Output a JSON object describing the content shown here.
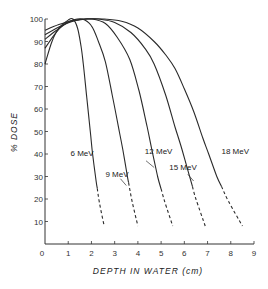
{
  "chart_data": {
    "type": "line",
    "title": "",
    "xlabel": "DEPTH IN WATER (cm)",
    "ylabel": "% DOSE",
    "xlim": [
      0,
      9
    ],
    "ylim": [
      0,
      100
    ],
    "x_ticks": [
      0,
      1,
      2,
      3,
      4,
      5,
      6,
      7,
      8,
      9
    ],
    "y_ticks": [
      10,
      20,
      30,
      40,
      50,
      60,
      70,
      80,
      90,
      100
    ],
    "grid": false,
    "legend": "inline labels",
    "series": [
      {
        "name": "6 MeV",
        "label": "6 MeV",
        "points": [
          [
            0,
            80
          ],
          [
            0.3,
            90
          ],
          [
            0.6,
            96
          ],
          [
            1.0,
            99.5
          ],
          [
            1.2,
            100
          ],
          [
            1.4,
            96
          ],
          [
            1.55,
            88
          ],
          [
            1.65,
            80
          ],
          [
            1.8,
            65
          ],
          [
            1.95,
            50
          ],
          [
            2.05,
            40
          ],
          [
            2.2,
            28
          ],
          [
            2.35,
            18
          ],
          [
            2.55,
            8
          ]
        ],
        "dashed_from": 2.25
      },
      {
        "name": "9 MeV",
        "label": "9 MeV",
        "points": [
          [
            0,
            87
          ],
          [
            0.4,
            93
          ],
          [
            0.8,
            97.5
          ],
          [
            1.2,
            99.5
          ],
          [
            1.6,
            100
          ],
          [
            2.0,
            97
          ],
          [
            2.3,
            90
          ],
          [
            2.6,
            81
          ],
          [
            2.9,
            66
          ],
          [
            3.2,
            50
          ],
          [
            3.35,
            42
          ],
          [
            3.55,
            30
          ],
          [
            3.75,
            19
          ],
          [
            4.0,
            8
          ]
        ],
        "dashed_from": 3.6
      },
      {
        "name": "12 MeV",
        "label": "12 MeV",
        "points": [
          [
            0,
            91
          ],
          [
            0.5,
            95
          ],
          [
            1.0,
            98.5
          ],
          [
            1.5,
            99.8
          ],
          [
            2.0,
            100
          ],
          [
            2.6,
            98
          ],
          [
            3.1,
            92
          ],
          [
            3.65,
            82
          ],
          [
            4.05,
            68
          ],
          [
            4.4,
            52
          ],
          [
            4.6,
            42
          ],
          [
            4.85,
            30
          ],
          [
            5.15,
            19
          ],
          [
            5.5,
            8
          ]
        ],
        "dashed_from": 5.0
      },
      {
        "name": "15 MeV",
        "label": "15 MeV",
        "points": [
          [
            0,
            93
          ],
          [
            0.6,
            96.5
          ],
          [
            1.2,
            99
          ],
          [
            1.8,
            100
          ],
          [
            2.3,
            100
          ],
          [
            3.0,
            98.5
          ],
          [
            3.7,
            94
          ],
          [
            4.3,
            87
          ],
          [
            4.7,
            80
          ],
          [
            5.2,
            66
          ],
          [
            5.6,
            52
          ],
          [
            5.9,
            42
          ],
          [
            6.2,
            31
          ],
          [
            6.5,
            20
          ],
          [
            6.9,
            8
          ]
        ],
        "dashed_from": 6.35
      },
      {
        "name": "18 MeV",
        "label": "18 MeV",
        "points": [
          [
            0,
            95
          ],
          [
            0.6,
            97.5
          ],
          [
            1.2,
            99.3
          ],
          [
            1.8,
            100
          ],
          [
            2.5,
            100
          ],
          [
            3.3,
            99
          ],
          [
            4.0,
            96
          ],
          [
            4.7,
            90
          ],
          [
            5.2,
            84
          ],
          [
            5.6,
            78
          ],
          [
            6.0,
            69
          ],
          [
            6.4,
            59
          ],
          [
            6.8,
            47
          ],
          [
            7.05,
            40
          ],
          [
            7.4,
            30
          ],
          [
            7.9,
            19
          ],
          [
            8.5,
            8
          ]
        ],
        "dashed_from": 7.6
      }
    ],
    "annotations": [
      {
        "text": "6 MeV",
        "x": 1.1,
        "y": 39
      },
      {
        "text": "9 MeV",
        "x": 2.6,
        "y": 30
      },
      {
        "text": "12 MeV",
        "x": 4.3,
        "y": 40
      },
      {
        "text": "15 MeV",
        "x": 5.35,
        "y": 33
      },
      {
        "text": "18 MeV",
        "x": 7.6,
        "y": 40
      }
    ]
  }
}
